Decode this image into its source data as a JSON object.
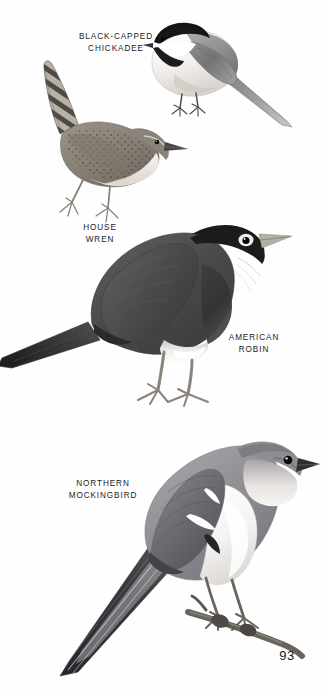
{
  "page": {
    "kind": "field-guide-plate",
    "page_number": "93",
    "background_color": "#ffffff",
    "text_color": "#1c1c1c"
  },
  "labels": {
    "chickadee": "BLACK-CAPPED\nCHICKADEE",
    "wren": "HOUSE\nWREN",
    "robin": "AMERICAN\nROBIN",
    "mockingbird": "NORTHERN\nMOCKINGBIRD"
  },
  "illustrations": [
    {
      "name": "black-capped-chickadee",
      "common_name": "BLACK-CAPPED CHICKADEE",
      "facing": "left",
      "pose": "perched, tail angled down-right",
      "features": [
        "black cap",
        "black bib",
        "white cheek",
        "gray back",
        "gray wing",
        "pale buff flanks",
        "white underparts",
        "short dark bill"
      ],
      "colors": {
        "cap": "#1a1a1a",
        "bib": "#222222",
        "cheek": "#ffffff",
        "back": "#8d8d8d",
        "wing": "#6f6f6f",
        "belly": "#f2f0ee",
        "bill": "#2b2b2b",
        "leg": "#555555"
      }
    },
    {
      "name": "house-wren",
      "common_name": "HOUSE WREN",
      "facing": "right",
      "pose": "perched, tail cocked up to the left",
      "features": [
        "barred cocked tail",
        "mottled brown back",
        "spotted flanks",
        "pale buff breast",
        "thin pointed bill",
        "dark eye"
      ],
      "colors": {
        "back": "#8b8378",
        "tail_bar_dark": "#4a4642",
        "tail_bar_light": "#c6c0b6",
        "breast": "#e8e4dd",
        "bill": "#3a3631",
        "leg": "#8a8378",
        "eye": "#141414"
      }
    },
    {
      "name": "american-robin",
      "common_name": "AMERICAN ROBIN",
      "facing": "right",
      "pose": "standing upright on ground",
      "features": [
        "blackish head",
        "white eye-ring",
        "dark breast",
        "slate-gray back",
        "white lower belly",
        "pale bill",
        "long legs"
      ],
      "colors": {
        "head": "#1b1b1b",
        "back": "#4d4d4d",
        "breast": "#3a3a3a",
        "belly": "#f4f2f0",
        "eye_ring": "#ffffff",
        "bill": "#b9b4ac",
        "leg": "#8c857c"
      }
    },
    {
      "name": "northern-mockingbird",
      "common_name": "NORTHERN MOCKINGBIRD",
      "facing": "right",
      "pose": "perched on a branch, long tail down-left",
      "features": [
        "gray upperparts",
        "white underparts",
        "two white wing bars",
        "white wing patch",
        "long dark tail with white outer feathers",
        "dark eye",
        "slender dark bill"
      ],
      "colors": {
        "back": "#97959a",
        "wing": "#6d6b70",
        "belly": "#fbfafa",
        "wingbar": "#ffffff",
        "tail": "#3d3c40",
        "bill": "#2e2d30",
        "leg": "#6b655f",
        "branch": "#57534d"
      }
    }
  ]
}
